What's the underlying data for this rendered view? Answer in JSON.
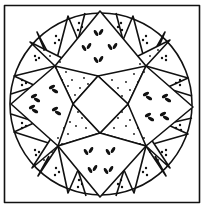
{
  "illustration": {
    "subject": "quilt block - star in circle (mariner's compass style)",
    "colors": {
      "ink": "#111111",
      "paper": "#ffffff"
    },
    "frame": {
      "x": 4,
      "y": 5,
      "width": 196,
      "height": 198
    },
    "circle": {
      "cx": 101,
      "cy": 104,
      "r": 91
    },
    "center_diamond": [
      [
        98,
        76
      ],
      [
        128,
        104
      ],
      [
        100,
        133
      ],
      [
        73,
        104
      ]
    ],
    "star_points_dotted": [
      {
        "name": "nw",
        "pts": [
          [
            98,
            76
          ],
          [
            73,
            104
          ],
          [
            55,
            66
          ],
          [
            30,
            42
          ]
        ]
      },
      {
        "name": "ne",
        "pts": [
          [
            98,
            76
          ],
          [
            128,
            104
          ],
          [
            146,
            66
          ],
          [
            170,
            40
          ]
        ]
      },
      {
        "name": "sw",
        "pts": [
          [
            73,
            104
          ],
          [
            100,
            133
          ],
          [
            58,
            146
          ],
          [
            32,
            168
          ]
        ]
      },
      {
        "name": "se",
        "pts": [
          [
            128,
            104
          ],
          [
            100,
            133
          ],
          [
            146,
            146
          ],
          [
            170,
            168
          ]
        ]
      }
    ],
    "cardinal_points_leaf": [
      {
        "name": "n",
        "pts": [
          [
            55,
            66
          ],
          [
            100,
            11
          ],
          [
            146,
            66
          ],
          [
            98,
            76
          ]
        ]
      },
      {
        "name": "s",
        "pts": [
          [
            58,
            146
          ],
          [
            100,
            197
          ],
          [
            146,
            146
          ],
          [
            100,
            133
          ]
        ]
      },
      {
        "name": "w",
        "pts": [
          [
            55,
            66
          ],
          [
            11,
            104
          ],
          [
            58,
            146
          ],
          [
            73,
            104
          ]
        ]
      },
      {
        "name": "e",
        "pts": [
          [
            146,
            66
          ],
          [
            193,
            107
          ],
          [
            146,
            146
          ],
          [
            128,
            104
          ]
        ]
      }
    ]
  }
}
